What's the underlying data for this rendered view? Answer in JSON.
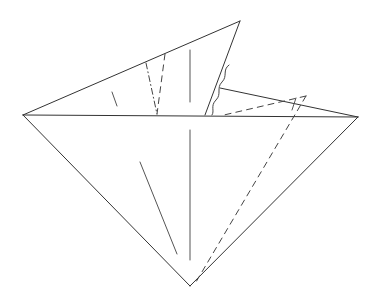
{
  "diagram": {
    "type": "origami-fold-step",
    "background": "#ffffff",
    "stroke_color": "#333333",
    "outline": [
      {
        "from": [
          23,
          115
        ],
        "to": [
          240,
          21
        ]
      },
      {
        "from": [
          23,
          115
        ],
        "to": [
          190,
          286
        ]
      },
      {
        "from": [
          190,
          286
        ],
        "to": [
          358,
          117
        ]
      },
      {
        "from": [
          23,
          115
        ],
        "to": [
          358,
          117
        ]
      },
      {
        "from": [
          240,
          21
        ],
        "to": [
          205,
          115
        ]
      },
      {
        "from": [
          220,
          88
        ],
        "to": [
          358,
          117
        ]
      }
    ],
    "valley_folds": [
      {
        "from": [
          306,
          96
        ],
        "to": [
          224,
          115
        ]
      },
      {
        "from": [
          306,
          96
        ],
        "to": [
          196,
          282
        ]
      },
      {
        "from": [
          165,
          54
        ],
        "to": [
          157,
          114
        ]
      }
    ],
    "mountain_folds": [
      {
        "from": [
          146,
          63
        ],
        "to": [
          157,
          114
        ]
      }
    ],
    "crease_lines": [
      {
        "from": [
          190,
          50
        ],
        "to": [
          190,
          102
        ]
      },
      {
        "from": [
          190,
          130
        ],
        "to": [
          190,
          260
        ]
      },
      {
        "from": [
          140,
          162
        ],
        "to": [
          177,
          254
        ]
      },
      {
        "from": [
          112,
          92
        ],
        "to": [
          117,
          106
        ]
      },
      {
        "from": [
          296,
          98
        ],
        "to": [
          292,
          110
        ]
      }
    ],
    "wavy_edge": "M229,65 C222,70 228,76 222,82 C216,88 222,94 216,100 C210,106 215,111 212,115"
  }
}
